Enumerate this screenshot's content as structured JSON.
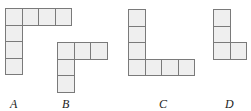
{
  "figure": {
    "cell_size": 16.5,
    "fill_color": "#efefef",
    "border_color": "#7a7a7a",
    "shapes": [
      {
        "label": "A",
        "origin": [
          5,
          8
        ],
        "cells": [
          [
            0,
            0
          ],
          [
            1,
            0
          ],
          [
            2,
            0
          ],
          [
            3,
            0
          ],
          [
            0,
            1
          ],
          [
            0,
            2
          ],
          [
            0,
            3
          ]
        ],
        "label_pos": [
          10,
          97
        ]
      },
      {
        "label": "B",
        "origin": [
          57,
          42
        ],
        "cells": [
          [
            0,
            0
          ],
          [
            1,
            0
          ],
          [
            2,
            0
          ],
          [
            0,
            1
          ],
          [
            0,
            2
          ]
        ],
        "label_pos": [
          62,
          97
        ]
      },
      {
        "label": "C",
        "origin": [
          128,
          9
        ],
        "cells": [
          [
            0,
            0
          ],
          [
            0,
            1
          ],
          [
            0,
            2
          ],
          [
            0,
            3
          ],
          [
            1,
            3
          ],
          [
            2,
            3
          ],
          [
            3,
            3
          ]
        ],
        "label_pos": [
          159,
          97
        ]
      },
      {
        "label": "D",
        "origin": [
          213,
          9
        ],
        "cells": [
          [
            0,
            0
          ],
          [
            0,
            1
          ],
          [
            0,
            2
          ],
          [
            1,
            2
          ]
        ],
        "label_pos": [
          225,
          97
        ]
      }
    ]
  }
}
